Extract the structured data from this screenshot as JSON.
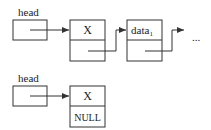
{
  "diagram": {
    "top_list": {
      "head_label": "head",
      "nodes": [
        {
          "data": "X"
        },
        {
          "data": "data",
          "subscript": "1"
        }
      ],
      "continuation": "..."
    },
    "bottom_list": {
      "head_label": "head",
      "nodes": [
        {
          "data": "X",
          "next": "NULL"
        }
      ]
    },
    "colors": {
      "stroke": "#333333",
      "text": "#222222",
      "background": "#ffffff"
    }
  }
}
